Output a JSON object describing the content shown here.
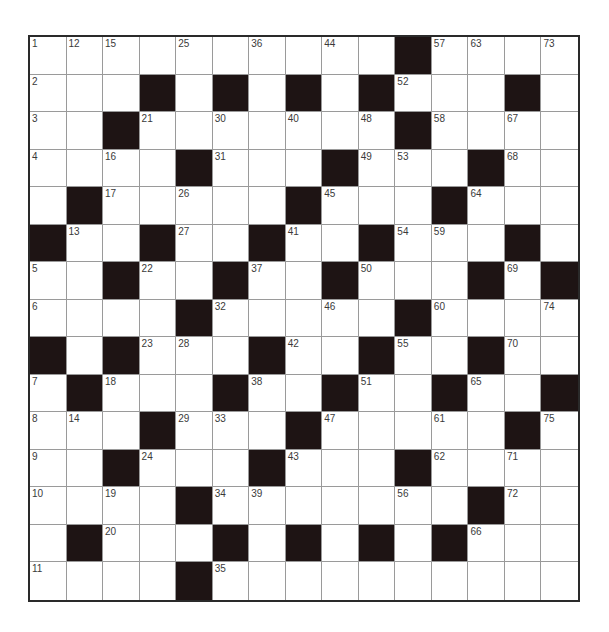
{
  "puzzle": {
    "rows": 15,
    "cols": 15,
    "colors": {
      "block": "#1e1414",
      "cell": "#ffffff",
      "line": "#9a9a9a",
      "border": "#2a2a2a",
      "number": "#3a3a3a"
    },
    "grid": [
      [
        "1",
        "12",
        "15",
        ".",
        "25",
        ".",
        "36",
        ".",
        "44",
        ".",
        "#",
        "57",
        "63",
        ".",
        "73"
      ],
      [
        "2",
        ".",
        ".",
        "#",
        ".",
        "#",
        ".",
        "#",
        ".",
        "#",
        "52",
        ".",
        ".",
        "#",
        "."
      ],
      [
        "3",
        ".",
        "#",
        "21",
        ".",
        "30",
        ".",
        "40",
        ".",
        "48",
        "#",
        "58",
        ".",
        "67",
        "."
      ],
      [
        "4",
        ".",
        "16",
        ".",
        "#",
        "31",
        ".",
        ".",
        "#",
        "49",
        "53",
        ".",
        "#",
        "68",
        "."
      ],
      [
        ".",
        "#",
        "17",
        ".",
        "26",
        ".",
        ".",
        "#",
        "45",
        ".",
        ".",
        "#",
        "64",
        ".",
        "."
      ],
      [
        "#",
        "13",
        ".",
        "#",
        "27",
        ".",
        "#",
        "41",
        ".",
        "#",
        "54",
        "59",
        ".",
        "#",
        "."
      ],
      [
        "5",
        ".",
        "#",
        "22",
        ".",
        "#",
        "37",
        ".",
        "#",
        "50",
        ".",
        ".",
        "#",
        "69",
        "#"
      ],
      [
        "6",
        ".",
        ".",
        ".",
        "#",
        "32",
        ".",
        ".",
        "46",
        ".",
        "#",
        "60",
        ".",
        ".",
        "74"
      ],
      [
        "#",
        ".",
        "#",
        "23",
        "28",
        ".",
        "#",
        "42",
        ".",
        "#",
        "55",
        ".",
        "#",
        "70",
        "."
      ],
      [
        "7",
        "#",
        "18",
        ".",
        ".",
        "#",
        "38",
        ".",
        "#",
        "51",
        ".",
        "#",
        "65",
        ".",
        "#"
      ],
      [
        "8",
        "14",
        ".",
        "#",
        "29",
        "33",
        ".",
        "#",
        "47",
        ".",
        ".",
        "61",
        ".",
        "#",
        "75"
      ],
      [
        "9",
        ".",
        "#",
        "24",
        ".",
        ".",
        "#",
        "43",
        ".",
        ".",
        "#",
        "62",
        ".",
        "71",
        "."
      ],
      [
        "10",
        ".",
        "19",
        ".",
        "#",
        "34",
        "39",
        ".",
        ".",
        ".",
        "56",
        ".",
        "#",
        "72",
        "."
      ],
      [
        ".",
        "#",
        "20",
        ".",
        ".",
        "#",
        ".",
        "#",
        ".",
        "#",
        ".",
        "#",
        "66",
        ".",
        "."
      ],
      [
        "11",
        ".",
        ".",
        ".",
        "#",
        "35",
        ".",
        ".",
        ".",
        ".",
        ".",
        ".",
        ".",
        ".",
        "."
      ]
    ]
  }
}
